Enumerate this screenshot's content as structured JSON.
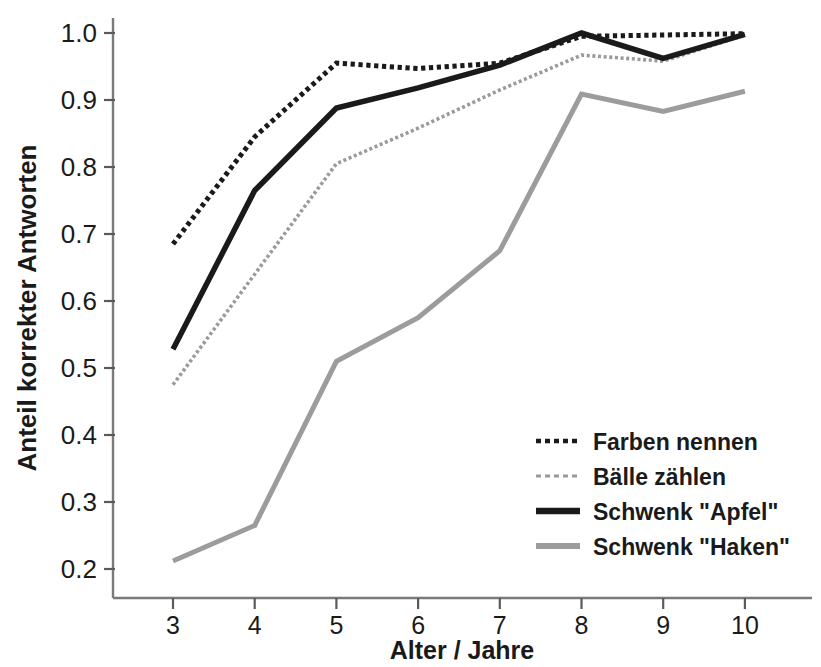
{
  "chart_data": {
    "type": "line",
    "title": "",
    "xlabel": "Alter / Jahre",
    "ylabel": "Anteil korrekter Antworten",
    "x": [
      3,
      4,
      5,
      6,
      7,
      8,
      9,
      10
    ],
    "xtick_labels": [
      "3",
      "4",
      "5",
      "6",
      "7",
      "8",
      "9",
      "10"
    ],
    "ytick_labels": [
      "1.0",
      "0.9",
      "0.8",
      "0.7",
      "0.6",
      "0.5",
      "0.4",
      "0.3",
      "0.2"
    ],
    "ytick_values": [
      1.0,
      0.9,
      0.8,
      0.7,
      0.6,
      0.5,
      0.4,
      0.3,
      0.2
    ],
    "xlim": [
      2.6,
      10.6
    ],
    "ylim": [
      0.155,
      1.04
    ],
    "grid": false,
    "legend_position": "lower-right",
    "series": [
      {
        "name": "Farben nennen",
        "style": "dotted",
        "color": "#1a1a1a",
        "width": 5,
        "values": [
          0.685,
          0.845,
          0.955,
          0.947,
          0.955,
          0.995,
          0.997,
          0.999
        ]
      },
      {
        "name": "Bälle zählen",
        "style": "dotted",
        "color": "#9a9a9a",
        "width": 3.6,
        "values": [
          0.475,
          0.64,
          0.805,
          0.858,
          0.915,
          0.967,
          0.958,
          0.997
        ]
      },
      {
        "name": "Schwenk \"Apfel\"",
        "style": "solid",
        "color": "#1a1a1a",
        "width": 5.5,
        "values": [
          0.528,
          0.765,
          0.888,
          0.918,
          0.952,
          1.0,
          0.962,
          0.998
        ]
      },
      {
        "name": "Schwenk \"Haken\"",
        "style": "solid",
        "color": "#9c9c9c",
        "width": 5,
        "values": [
          0.212,
          0.265,
          0.51,
          0.575,
          0.675,
          0.909,
          0.883,
          0.913
        ]
      }
    ]
  },
  "legend": {
    "entries": [
      {
        "label": "Farben nennen"
      },
      {
        "label": "Bälle zählen"
      },
      {
        "label": "Schwenk \"Apfel\""
      },
      {
        "label": "Schwenk \"Haken\""
      }
    ]
  },
  "axes": {
    "x_title": "Alter / Jahre",
    "y_title": "Anteil korrekter Antworten"
  }
}
